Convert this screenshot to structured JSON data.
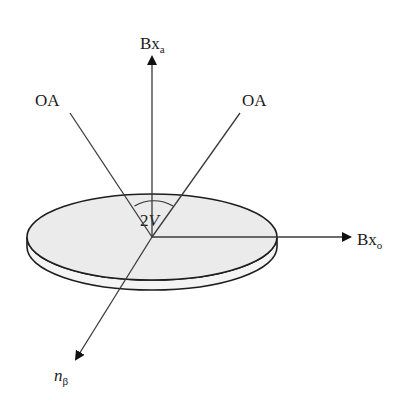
{
  "diagram": {
    "colors": {
      "line": "#3a3a3a",
      "disc_fill": "#ebebeb",
      "disc_stroke": "#1e1e1e",
      "background": "#ffffff"
    },
    "origin": {
      "x": 152,
      "y": 237
    },
    "axes": [
      {
        "id": "bxa",
        "label": "Bx",
        "subscript": "a",
        "direction": "up",
        "arrow": true
      },
      {
        "id": "bxo",
        "label": "Bx",
        "subscript": "o",
        "direction": "right",
        "arrow": true
      },
      {
        "id": "nbeta",
        "label": "n",
        "subscript": "β",
        "direction": "down-left",
        "arrow": true,
        "label_italic": true
      }
    ],
    "optic_axes": [
      {
        "id": "oa-left",
        "label": "OA"
      },
      {
        "id": "oa-right",
        "label": "OA"
      }
    ],
    "angle": {
      "label_number": "2",
      "label_var": "V",
      "description": "angle between optic axes"
    },
    "disc": {
      "shape": "ellipse",
      "description": "optic plane shown as a thin disc"
    }
  }
}
